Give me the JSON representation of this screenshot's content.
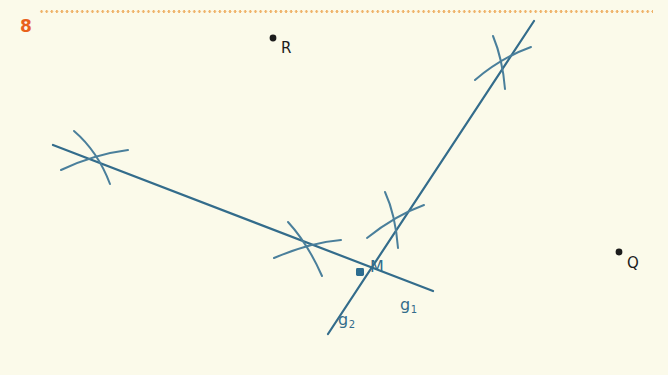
{
  "page": {
    "exercise_number": "8",
    "background_color": "#fbfaea",
    "rule_color": "#efb36a",
    "ink_color": "#336c8b",
    "point_color": "#1c1c1c"
  },
  "figure": {
    "type": "geometry-construction",
    "lines": [
      {
        "name": "g1",
        "label": "g",
        "subscript": "1",
        "x1": 53,
        "y1": 145,
        "x2": 433,
        "y2": 291
      },
      {
        "name": "g2",
        "label": "g",
        "subscript": "2",
        "x1": 534,
        "y1": 21,
        "x2": 328,
        "y2": 334
      }
    ],
    "points": [
      {
        "name": "M",
        "label": "M",
        "x": 360,
        "y": 272,
        "style": "filled-square-blue"
      },
      {
        "name": "R",
        "label": "R",
        "x": 273,
        "y": 38,
        "style": "filled-dot-black"
      },
      {
        "name": "Q",
        "label": "Q",
        "x": 619,
        "y": 252,
        "style": "filled-dot-black"
      }
    ],
    "construction_marks": [
      {
        "name": "arc-cross-upper-left",
        "x": 93,
        "y": 158
      },
      {
        "name": "arc-cross-middle",
        "x": 306,
        "y": 248
      },
      {
        "name": "arc-cross-upper-mid",
        "x": 396,
        "y": 218
      },
      {
        "name": "arc-cross-upper-right",
        "x": 503,
        "y": 61
      }
    ]
  }
}
